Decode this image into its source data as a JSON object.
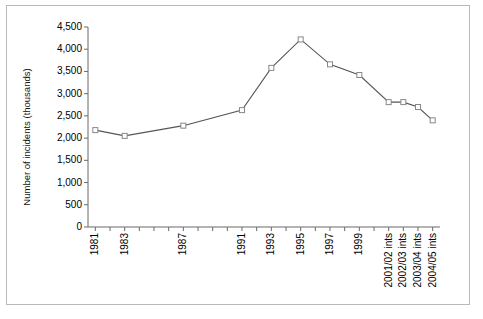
{
  "chart_data": {
    "type": "line",
    "title": "",
    "xlabel": "",
    "ylabel": "Number of incidents (thousands)",
    "ylim": [
      0,
      4500
    ],
    "ytick_labels": [
      "4,500",
      "4,000",
      "3,500",
      "3,000",
      "2,500",
      "2,000",
      "1,500",
      "1,000",
      "500",
      "0"
    ],
    "ytick_values": [
      4500,
      4000,
      3500,
      3000,
      2500,
      2000,
      1500,
      1000,
      500,
      0
    ],
    "grid": false,
    "legend": "none",
    "marker": "open-square",
    "line_color": "#555555",
    "marker_color": "#888888",
    "categories": [
      "1981",
      "1983",
      "1987",
      "1991",
      "1993",
      "1995",
      "1997",
      "1999",
      "2001/02 ints",
      "2002/03 ints",
      "2003/04 ints",
      "2004/05 ints"
    ],
    "x_positions": [
      0,
      2,
      6,
      10,
      12,
      14,
      16,
      18,
      20,
      21,
      22,
      23
    ],
    "x_axis_ticks": 24,
    "values": [
      2180,
      2050,
      2280,
      2630,
      3580,
      4220,
      3660,
      3420,
      2810,
      2810,
      2700,
      2400
    ],
    "points": [
      {
        "label": "1981",
        "value": 2180
      },
      {
        "label": "1983",
        "value": 2050
      },
      {
        "label": "1987",
        "value": 2280
      },
      {
        "label": "1991",
        "value": 2630
      },
      {
        "label": "1993",
        "value": 3580
      },
      {
        "label": "1995",
        "value": 4220
      },
      {
        "label": "1997",
        "value": 3660
      },
      {
        "label": "1999",
        "value": 3420
      },
      {
        "label": "2001/02 ints",
        "value": 2810
      },
      {
        "label": "2002/03 ints",
        "value": 2810
      },
      {
        "label": "2003/04 ints",
        "value": 2700
      },
      {
        "label": "2004/05 ints",
        "value": 2400
      }
    ]
  },
  "style": {
    "border_color": "#b9b9b9",
    "axis_color": "#6a6a6a",
    "text_color": "#000000",
    "background": "#ffffff"
  }
}
